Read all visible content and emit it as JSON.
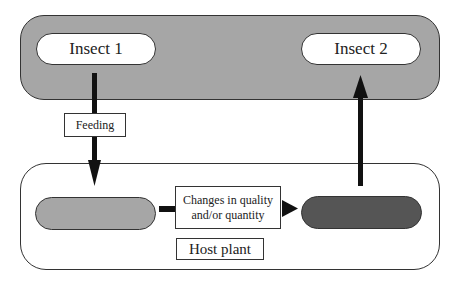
{
  "diagram": {
    "top_band": {
      "fill": "#a6a6a6"
    },
    "nodes": {
      "insect1": {
        "label": "Insect 1"
      },
      "insect2": {
        "label": "Insect 2"
      },
      "plant_before": {
        "label": "",
        "fill": "#a6a6a6"
      },
      "plant_after": {
        "label": "",
        "fill": "#555555"
      }
    },
    "edge_labels": {
      "feeding": "Feeding",
      "changes_line1": "Changes in quality",
      "changes_line2": "and/or quantity"
    },
    "container_label": "Host plant"
  }
}
